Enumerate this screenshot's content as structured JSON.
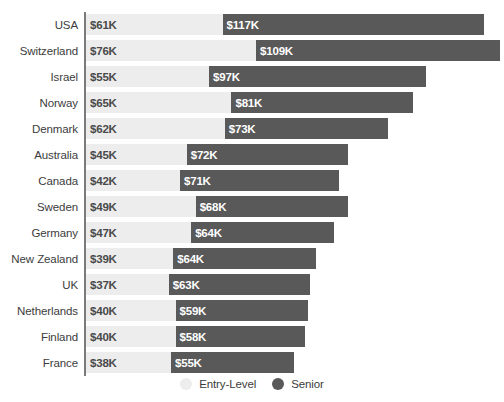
{
  "chart_data": {
    "type": "bar",
    "orientation": "horizontal",
    "stacked": true,
    "title": "",
    "subtitle": "",
    "xlabel": "",
    "ylabel": "",
    "grid": false,
    "legend_position": "bottom-center",
    "xlim": [
      0,
      190
    ],
    "value_unit": "K",
    "value_prefix": "$",
    "categories": [
      "USA",
      "Switzerland",
      "Israel",
      "Norway",
      "Denmark",
      "Australia",
      "Canada",
      "Sweden",
      "Germany",
      "New Zealand",
      "UK",
      "Netherlands",
      "Finland",
      "France"
    ],
    "series": [
      {
        "name": "Entry-Level",
        "color": "#ededed",
        "values": [
          61,
          76,
          55,
          65,
          62,
          45,
          42,
          49,
          47,
          39,
          37,
          40,
          40,
          38
        ],
        "labels": [
          "$61K",
          "$76K",
          "$55K",
          "$65K",
          "$62K",
          "$45K",
          "$42K",
          "$49K",
          "$47K",
          "$39K",
          "$37K",
          "$40K",
          "$40K",
          "$38K"
        ]
      },
      {
        "name": "Senior",
        "color": "#595959",
        "values": [
          117,
          109,
          97,
          81,
          73,
          72,
          71,
          68,
          64,
          64,
          63,
          59,
          58,
          55
        ],
        "labels": [
          "$117K",
          "$109K",
          "$97K",
          "$81K",
          "$73K",
          "$72K",
          "$71K",
          "$68K",
          "$64K",
          "$64K",
          "$63K",
          "$59K",
          "$58K",
          "$55K"
        ]
      }
    ]
  },
  "legend": {
    "items": [
      {
        "label": "Entry-Level",
        "color": "#ededed"
      },
      {
        "label": "Senior",
        "color": "#595959"
      }
    ]
  }
}
